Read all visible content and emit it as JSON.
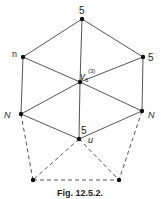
{
  "diagram": {
    "vertices": {
      "top": {
        "x": 82,
        "y": 19,
        "label": "5"
      },
      "upper_left": {
        "x": 23,
        "y": 57,
        "label": "n"
      },
      "upper_right": {
        "x": 143,
        "y": 57,
        "label": "5"
      },
      "center": {
        "x": 80,
        "y": 82,
        "label": "v",
        "subscript": "6",
        "superscript": "(3)"
      },
      "lower_left": {
        "x": 21,
        "y": 114,
        "label": "N"
      },
      "lower_right": {
        "x": 142,
        "y": 111,
        "label": "N"
      },
      "bottom_center": {
        "x": 79,
        "y": 139,
        "label_degree": "5",
        "label_name": "u"
      },
      "bottom_left": {
        "x": 33,
        "y": 180
      },
      "bottom_right": {
        "x": 119,
        "y": 180
      }
    },
    "solid_edges": [
      [
        "top",
        "upper_left"
      ],
      [
        "top",
        "upper_right"
      ],
      [
        "top",
        "center"
      ],
      [
        "upper_left",
        "center"
      ],
      [
        "upper_right",
        "center"
      ],
      [
        "upper_left",
        "lower_left"
      ],
      [
        "upper_right",
        "lower_right"
      ],
      [
        "center",
        "lower_left"
      ],
      [
        "center",
        "lower_right"
      ],
      [
        "center",
        "bottom_center"
      ],
      [
        "lower_left",
        "bottom_center"
      ],
      [
        "lower_right",
        "bottom_center"
      ]
    ],
    "dashed_edges": [
      [
        "lower_left",
        "bottom_left"
      ],
      [
        "lower_right",
        "bottom_right"
      ],
      [
        "bottom_center",
        "bottom_left"
      ],
      [
        "bottom_center",
        "bottom_right"
      ],
      [
        "bottom_left",
        "bottom_right"
      ]
    ],
    "caption": "Fig. 12.5.2."
  }
}
